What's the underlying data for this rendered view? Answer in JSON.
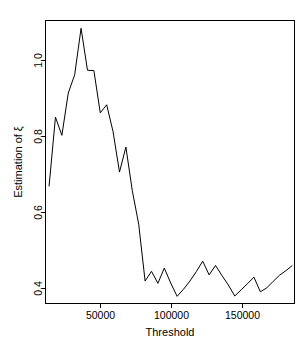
{
  "chart_data": {
    "type": "line",
    "title": "",
    "xlabel": "Threshold",
    "ylabel": "Estimation of ξ",
    "ylabel_parts": {
      "prefix": "Estimation of ",
      "symbol": "ξ"
    },
    "xlim": [
      12000,
      187000
    ],
    "ylim": [
      0.305,
      1.175
    ],
    "xticks": [
      50000,
      100000,
      150000
    ],
    "xtick_labels": [
      "50000",
      "100000",
      "150000"
    ],
    "yticks": [
      0.4,
      0.6,
      0.8,
      1.0
    ],
    "ytick_labels": [
      "0.4",
      "0.6",
      "0.8",
      "1.0"
    ],
    "grid": false,
    "legend": null,
    "legend_position": "none",
    "line_color": "#000000",
    "background_color": "#ffffff",
    "frame": "box",
    "series": [
      {
        "name": "Estimation of xi",
        "x": [
          14500,
          19000,
          23500,
          28000,
          32500,
          37000,
          41500,
          46000,
          50500,
          55000,
          59500,
          64000,
          68500,
          73000,
          77500,
          82000,
          86500,
          91000,
          95500,
          100000,
          104500,
          109000,
          113500,
          118000,
          122500,
          127000,
          131500,
          136000,
          140500,
          145000,
          149500,
          154000,
          158500,
          163000,
          167500,
          172000,
          176500,
          181000,
          185500
        ],
        "y": [
          0.665,
          0.878,
          0.822,
          0.952,
          1.008,
          1.151,
          1.022,
          1.021,
          0.891,
          0.916,
          0.833,
          0.709,
          0.786,
          0.652,
          0.549,
          0.374,
          0.404,
          0.367,
          0.414,
          0.368,
          0.327,
          0.349,
          0.374,
          0.403,
          0.435,
          0.393,
          0.422,
          0.391,
          0.362,
          0.328,
          0.347,
          0.366,
          0.386,
          0.341,
          0.353,
          0.373,
          0.392,
          0.406,
          0.422
        ]
      }
    ]
  },
  "axis_titles": {
    "x": "Threshold",
    "y_prefix": "Estimation of ",
    "y_symbol": "ξ"
  }
}
